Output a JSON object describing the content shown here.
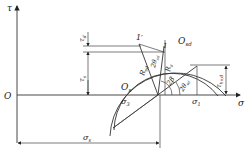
{
  "diagram": {
    "type": "mohr-circle",
    "axes": {
      "vertical_label": "τ",
      "horizontal_label": "σ",
      "origin_label": "O"
    },
    "circles": [
      {
        "name": "outer",
        "label": "O",
        "label_sub": "sd"
      },
      {
        "name": "inner",
        "label": "O",
        "label_sub": "s"
      }
    ],
    "points": {
      "p1_prime": "1′",
      "p1": "1"
    },
    "radii": {
      "outer": {
        "label": "R",
        "sub": "sd"
      },
      "inner": {
        "label": "R",
        "sub": "s"
      }
    },
    "angles": {
      "two_theta_d": {
        "prefix": "2θ",
        "sub": "sd"
      },
      "two_beta": "2β",
      "two_theta_sd_lower": {
        "prefix": "2θ",
        "sub": "sd"
      }
    },
    "stresses": {
      "sigma3": {
        "label": "σ",
        "sub": "3"
      },
      "sigma1": {
        "label": "σ",
        "sub": "1"
      },
      "sigma_s": {
        "label": "σ",
        "sub": "s"
      },
      "tau_d": {
        "label": "τ",
        "sub": "d"
      },
      "tau_s": {
        "label": "τ",
        "sub": "s"
      },
      "tau_hvd": {
        "label": "τ",
        "sub": "hv,d"
      }
    }
  }
}
